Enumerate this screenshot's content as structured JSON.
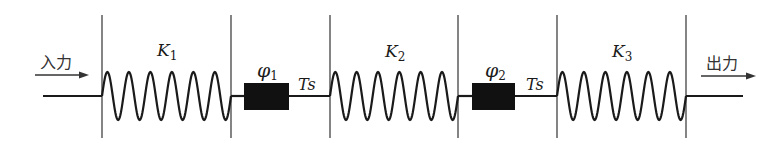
{
  "diagram": {
    "type": "signal-flow",
    "input_label": "入力",
    "output_label": "出力",
    "stages": [
      {
        "id": "K1",
        "kind": "spring",
        "label": "K",
        "subscript": "1"
      },
      {
        "id": "phi1",
        "kind": "block",
        "label": "φ",
        "subscript": "1"
      },
      {
        "id": "Ts1",
        "kind": "delay",
        "label": "Ts"
      },
      {
        "id": "K2",
        "kind": "spring",
        "label": "K",
        "subscript": "2"
      },
      {
        "id": "phi2",
        "kind": "block",
        "label": "φ",
        "subscript": "2"
      },
      {
        "id": "Ts2",
        "kind": "delay",
        "label": "Ts"
      },
      {
        "id": "K3",
        "kind": "spring",
        "label": "K",
        "subscript": "3"
      }
    ],
    "colors": {
      "line": "#1a1a1a",
      "block": "#111111",
      "boundary": "#333333",
      "background": "#ffffff"
    }
  }
}
